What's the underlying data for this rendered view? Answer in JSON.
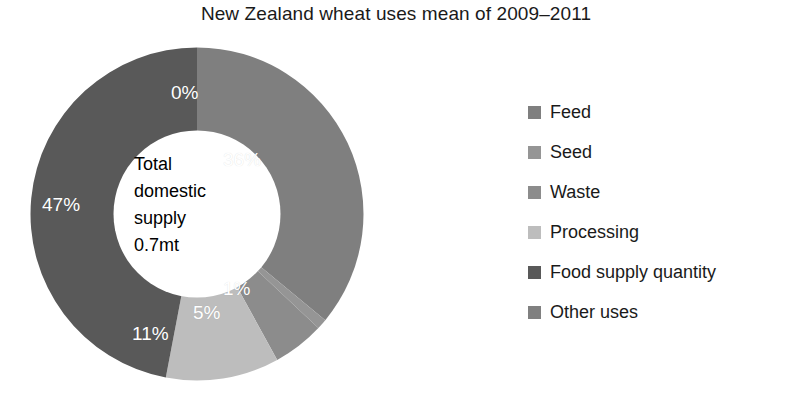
{
  "title": "New Zealand wheat uses mean of 2009–2011",
  "center": {
    "line1": "Total",
    "line2": "domestic",
    "line3": "supply",
    "line4": "0.7mt"
  },
  "legend": {
    "items": [
      {
        "label": "Feed",
        "color": "#7f7f7f"
      },
      {
        "label": "Seed",
        "color": "#959595"
      },
      {
        "label": "Waste",
        "color": "#8c8c8c"
      },
      {
        "label": "Processing",
        "color": "#bdbdbd"
      },
      {
        "label": "Food supply quantity",
        "color": "#595959"
      },
      {
        "label": "Other uses",
        "color": "#808080"
      }
    ]
  },
  "chart_data": {
    "type": "pie",
    "variant": "donut",
    "title": "New Zealand wheat uses mean of 2009–2011",
    "center_text": "Total domestic supply 0.7mt",
    "total_label": "Total domestic supply",
    "total_value": "0.7mt",
    "units": "percent of total domestic supply",
    "legend_position": "right",
    "start_angle_deg": 0,
    "direction": "clockwise",
    "inner_radius_ratio": 0.5,
    "categories": [
      "Feed",
      "Seed",
      "Waste",
      "Processing",
      "Food supply quantity",
      "Other uses"
    ],
    "values": [
      36,
      1,
      5,
      11,
      47,
      0
    ],
    "labels": [
      "36%",
      "1%",
      "5%",
      "11%",
      "47%",
      "0%"
    ],
    "colors": [
      "#7f7f7f",
      "#959595",
      "#8c8c8c",
      "#bdbdbd",
      "#595959",
      "#808080"
    ],
    "slices": [
      {
        "name": "Feed",
        "value": 36,
        "label": "36%",
        "color": "#7f7f7f"
      },
      {
        "name": "Seed",
        "value": 1,
        "label": "1%",
        "color": "#959595"
      },
      {
        "name": "Waste",
        "value": 5,
        "label": "5%",
        "color": "#8c8c8c"
      },
      {
        "name": "Processing",
        "value": 11,
        "label": "11%",
        "color": "#bdbdbd"
      },
      {
        "name": "Food supply quantity",
        "value": 47,
        "label": "47%",
        "color": "#595959"
      },
      {
        "name": "Other uses",
        "value": 0,
        "label": "0%",
        "color": "#808080"
      }
    ]
  },
  "slice_labels": {
    "feed": "36%",
    "seed": "1%",
    "waste": "5%",
    "processing": "11%",
    "food_supply_quantity": "47%",
    "other_uses": "0%"
  }
}
